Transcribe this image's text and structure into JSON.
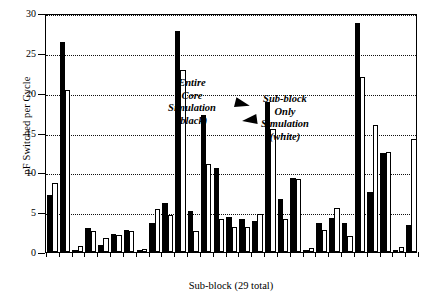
{
  "chart_data": {
    "type": "bar",
    "title": "",
    "xlabel": "Sub-block (29 total)",
    "ylabel": "pF Switched per Cycle",
    "ylim": [
      0,
      30
    ],
    "yticks": [
      0,
      5,
      10,
      15,
      20,
      25,
      30
    ],
    "ytick_labels": [
      "0",
      "5",
      "10",
      "15",
      "20",
      "25",
      "30"
    ],
    "grid": "horizontal-dotted",
    "legend_position": "inside-annotations",
    "categories": [
      "1",
      "2",
      "3",
      "4",
      "5",
      "6",
      "7",
      "8",
      "9",
      "10",
      "11",
      "12",
      "13",
      "14",
      "15",
      "16",
      "17",
      "18",
      "19",
      "20",
      "21",
      "22",
      "23",
      "24",
      "25",
      "26",
      "27",
      "28",
      "29"
    ],
    "series": [
      {
        "name": "Entire Core Simulation (black)",
        "color": "#000000",
        "values": [
          7.2,
          26.3,
          0.3,
          3.0,
          0.9,
          2.2,
          2.8,
          0.2,
          3.7,
          6.2,
          27.8,
          5.2,
          17.2,
          10.6,
          4.4,
          4.2,
          3.9,
          18.8,
          6.7,
          9.3,
          0.3,
          3.6,
          4.3,
          3.7,
          28.7,
          7.5,
          12.4,
          0.2,
          3.4
        ]
      },
      {
        "name": "Sub-block Only Simulation (white)",
        "color": "#ffffff",
        "values": [
          8.7,
          20.3,
          0.7,
          2.7,
          1.7,
          2.1,
          2.6,
          0.4,
          5.4,
          4.6,
          22.8,
          2.6,
          11.0,
          4.1,
          3.1,
          3.2,
          4.8,
          15.4,
          4.2,
          9.2,
          0.5,
          2.8,
          5.5,
          2.0,
          22.0,
          16.0,
          12.6,
          0.6,
          14.2
        ]
      }
    ],
    "annotations": [
      {
        "id": "entire-core",
        "lines": [
          "Entire",
          "Core",
          "Simulation",
          "(black)"
        ],
        "points_to": "tall black bar near center-left"
      },
      {
        "id": "sub-block-only",
        "lines": [
          "Sub-block",
          "Only",
          "Simulation",
          "(white)"
        ],
        "points_to": "tall white bar near center"
      }
    ]
  }
}
